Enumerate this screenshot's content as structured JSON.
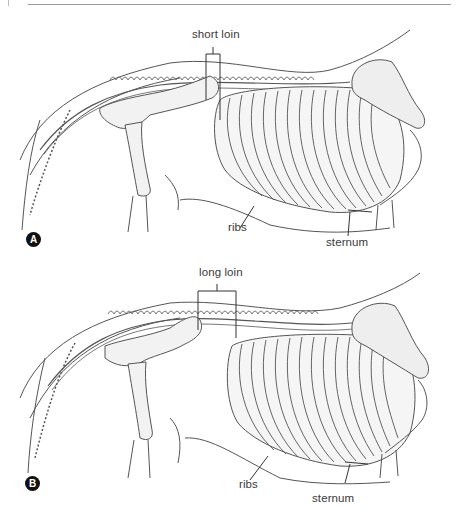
{
  "figure": {
    "panels": [
      {
        "id": "A",
        "badge": "A",
        "labels": {
          "loin": "short loin",
          "ribs": "ribs",
          "sternum": "sternum"
        }
      },
      {
        "id": "B",
        "badge": "B",
        "labels": {
          "loin": "long loin",
          "ribs": "ribs",
          "sternum": "sternum"
        }
      }
    ]
  },
  "colors": {
    "ink": "#3a3a3a",
    "badge": "#111111",
    "rule": "#9a9a9a"
  }
}
